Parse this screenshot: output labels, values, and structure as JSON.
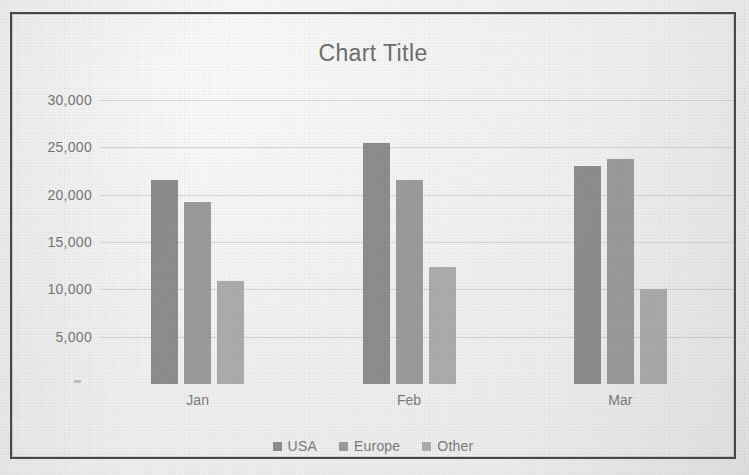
{
  "chart_data": {
    "type": "bar",
    "title": "Chart Title",
    "xlabel": "",
    "ylabel": "",
    "grid": true,
    "legend_position": "bottom",
    "categories": [
      "Jan",
      "Feb",
      "Mar"
    ],
    "ylim": [
      0,
      30000
    ],
    "ytick_labels": [
      "30,000",
      "25,000",
      "20,000",
      "15,000",
      "10,000",
      "5,000"
    ],
    "ytick_values": [
      30000,
      25000,
      20000,
      15000,
      10000,
      5000
    ],
    "series": [
      {
        "name": "USA",
        "color": "#8c8c8c",
        "values": [
          21500,
          25500,
          23000
        ]
      },
      {
        "name": "Europe",
        "color": "#9a9a9a",
        "values": [
          19200,
          21500,
          23800
        ]
      },
      {
        "name": "Other",
        "color": "#ababab",
        "values": [
          10900,
          12400,
          10000
        ]
      }
    ]
  },
  "legend": {
    "items": [
      {
        "label": "USA",
        "marker": "square-swatch-icon"
      },
      {
        "label": "Europe",
        "marker": "square-swatch-icon"
      },
      {
        "label": "Other",
        "marker": "square-swatch-icon"
      }
    ]
  },
  "frame": {
    "border_color": "#4a4a4a",
    "background": "#f3f3f1"
  }
}
